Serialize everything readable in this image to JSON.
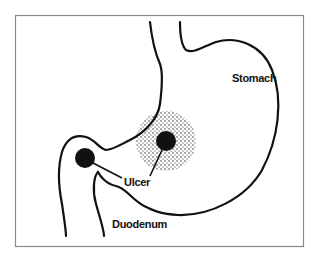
{
  "diagram": {
    "type": "anatomical illustration",
    "labels": {
      "stomach": "Stomach",
      "ulcer": "Ulcer",
      "duodenum": "Duodenum"
    },
    "ulcers": [
      {
        "location": "duodenal bulb",
        "cx": 85,
        "cy": 158
      },
      {
        "location": "stomach lesser curvature",
        "cx": 166,
        "cy": 141
      }
    ],
    "colors": {
      "outline": "#111111",
      "frame": "#8a8a8a",
      "background": "#ffffff",
      "ulcer": "#111111"
    }
  }
}
